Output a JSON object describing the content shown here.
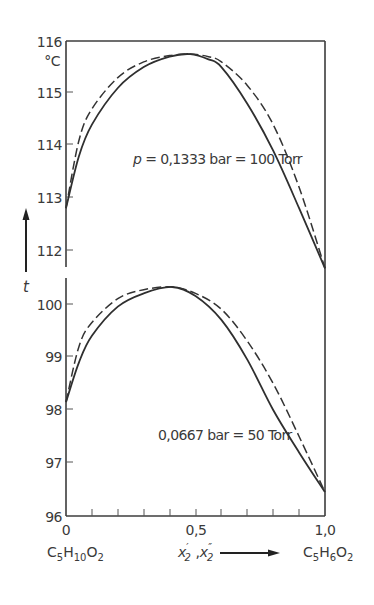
{
  "chart_data": {
    "type": "line",
    "title": "",
    "xlabel": "x'_2 , x''_2",
    "ylabel": "t",
    "y_unit": "°C",
    "x_range": [
      0,
      1.0
    ],
    "x_ticks": [
      0,
      0.1,
      0.2,
      0.3,
      0.4,
      0.5,
      0.6,
      0.7,
      0.8,
      0.9,
      1.0
    ],
    "x_tick_labels": [
      "0",
      "0,5",
      "1,0"
    ],
    "x_end_labels": {
      "left": "C5H10O2",
      "right": "C5H6O2"
    },
    "grid": false,
    "panels": [
      {
        "name": "upper",
        "annotation": "p = 0,1333 bar = 100 Torr",
        "ylim": [
          111.5,
          116
        ],
        "y_tick_labels": [
          "112",
          "113",
          "114",
          "115",
          "116"
        ],
        "series": [
          {
            "name": "liquid (solid)",
            "style": "solid",
            "x": [
              0,
              0.05,
              0.1,
              0.2,
              0.3,
              0.4,
              0.48,
              0.55,
              0.6,
              0.7,
              0.8,
              0.9,
              1.0
            ],
            "y": [
              112.8,
              113.8,
              114.4,
              115.1,
              115.5,
              115.7,
              115.75,
              115.65,
              115.5,
              114.8,
              113.9,
              112.8,
              111.65
            ]
          },
          {
            "name": "vapor (dashed)",
            "style": "dashed",
            "x": [
              0,
              0.05,
              0.1,
              0.2,
              0.3,
              0.4,
              0.48,
              0.55,
              0.6,
              0.7,
              0.8,
              0.9,
              1.0
            ],
            "y": [
              112.8,
              114.1,
              114.7,
              115.3,
              115.6,
              115.72,
              115.75,
              115.7,
              115.6,
              115.15,
              114.4,
              113.2,
              111.65
            ]
          }
        ]
      },
      {
        "name": "lower",
        "annotation": "0,0667 bar = 50 Torr",
        "ylim": [
          96,
          100.5
        ],
        "y_tick_labels": [
          "96",
          "97",
          "98",
          "99",
          "100"
        ],
        "series": [
          {
            "name": "liquid (solid)",
            "style": "solid",
            "x": [
              0,
              0.05,
              0.1,
              0.2,
              0.3,
              0.41,
              0.5,
              0.6,
              0.7,
              0.8,
              0.9,
              1.0
            ],
            "y": [
              98.15,
              98.9,
              99.4,
              99.95,
              100.2,
              100.32,
              100.15,
              99.7,
              98.95,
              98.0,
              97.2,
              96.45
            ]
          },
          {
            "name": "vapor (dashed)",
            "style": "dashed",
            "x": [
              0,
              0.05,
              0.1,
              0.2,
              0.3,
              0.41,
              0.5,
              0.6,
              0.7,
              0.8,
              0.9,
              1.0
            ],
            "y": [
              98.15,
              99.2,
              99.65,
              100.1,
              100.27,
              100.32,
              100.2,
              99.9,
              99.3,
              98.5,
              97.5,
              96.45
            ]
          }
        ]
      }
    ]
  },
  "labels": {
    "y_116": "116",
    "y_unit": "°C",
    "y_115": "115",
    "y_114": "114",
    "y_113": "113",
    "y_112": "112",
    "y_100": "100",
    "y_99": "99",
    "y_98": "98",
    "y_97": "97",
    "y_96": "96",
    "x_0": "0",
    "x_05": "0,5",
    "x_10": "1,0",
    "ylabel": "t",
    "upper_annotation_p": "p",
    "upper_annotation_rest": " = 0,1333 bar = 100 Torr",
    "lower_annotation": "0,0667 bar = 50 Torr",
    "left_compound": {
      "c": "C",
      "s1": "5",
      "h": "H",
      "s2": "10",
      "o": "O",
      "s3": "2"
    },
    "right_compound": {
      "c": "C",
      "s1": "5",
      "h": "H",
      "s2": "6",
      "o": "O",
      "s3": "2"
    },
    "xlabel": {
      "x1": "x",
      "p1": "′",
      "s1": "2",
      "sep": " ,",
      "x2": "x",
      "p2": "″",
      "s2": "2"
    }
  }
}
